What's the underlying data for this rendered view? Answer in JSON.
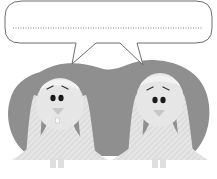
{
  "illustration": {
    "speech_bubble": {
      "text": "",
      "line_style": "dotted"
    },
    "characters": [
      {
        "name": "left-bunny",
        "expression": "worried"
      },
      {
        "name": "right-bunny",
        "expression": "worried"
      }
    ],
    "colors": {
      "background": "#ffffff",
      "blob": "#8f8f8f",
      "bunny_fill": "#e4e4e4",
      "bunny_shade": "#d2d2d2",
      "bubble_stroke": "#6e6e6e",
      "dots": "#7a7a7a",
      "eyes": "#1a1a1a"
    }
  }
}
